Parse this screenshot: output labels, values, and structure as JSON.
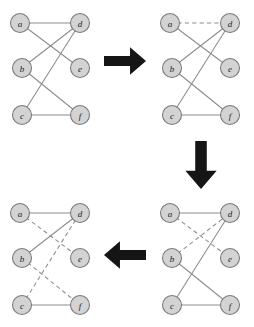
{
  "figure": {
    "title": "",
    "node_fill": "#d3d3d3",
    "node_stroke": "#7a7a7a",
    "edge_color": "#8c8c8c",
    "arrow_color": "#151515",
    "node_radius": 9.5
  },
  "node_positions": {
    "a": {
      "x": 18,
      "y": 21
    },
    "b": {
      "x": 20,
      "y": 66
    },
    "c": {
      "x": 20,
      "y": 113
    },
    "d": {
      "x": 78,
      "y": 21
    },
    "e": {
      "x": 78,
      "y": 66
    },
    "f": {
      "x": 78,
      "y": 113
    }
  },
  "panels": [
    {
      "id": "panel-top-left",
      "name": "graph-initial",
      "x": 2,
      "y": 2,
      "width": 98,
      "height": 135,
      "nodes": [
        {
          "id": "a",
          "label": "a"
        },
        {
          "id": "b",
          "label": "b"
        },
        {
          "id": "c",
          "label": "c"
        },
        {
          "id": "d",
          "label": "d"
        },
        {
          "id": "e",
          "label": "e"
        },
        {
          "id": "f",
          "label": "f"
        }
      ],
      "edges": [
        {
          "from": "a",
          "to": "d",
          "style": "solid"
        },
        {
          "from": "a",
          "to": "e",
          "style": "solid"
        },
        {
          "from": "b",
          "to": "d",
          "style": "solid"
        },
        {
          "from": "b",
          "to": "f",
          "style": "solid"
        },
        {
          "from": "c",
          "to": "d",
          "style": "solid"
        },
        {
          "from": "c",
          "to": "f",
          "style": "solid"
        }
      ]
    },
    {
      "id": "panel-top-right",
      "name": "graph-step-2",
      "x": 152,
      "y": 2,
      "width": 98,
      "height": 135,
      "nodes": [
        {
          "id": "a",
          "label": "a"
        },
        {
          "id": "b",
          "label": "b"
        },
        {
          "id": "c",
          "label": "c"
        },
        {
          "id": "d",
          "label": "d"
        },
        {
          "id": "e",
          "label": "e"
        },
        {
          "id": "f",
          "label": "f"
        }
      ],
      "edges": [
        {
          "from": "a",
          "to": "d",
          "style": "dashed"
        },
        {
          "from": "a",
          "to": "e",
          "style": "solid"
        },
        {
          "from": "b",
          "to": "d",
          "style": "solid"
        },
        {
          "from": "b",
          "to": "f",
          "style": "solid"
        },
        {
          "from": "c",
          "to": "d",
          "style": "solid"
        },
        {
          "from": "c",
          "to": "f",
          "style": "solid"
        }
      ]
    },
    {
      "id": "panel-bottom-right",
      "name": "graph-step-3",
      "x": 152,
      "y": 192,
      "width": 98,
      "height": 135,
      "nodes": [
        {
          "id": "a",
          "label": "a"
        },
        {
          "id": "b",
          "label": "b"
        },
        {
          "id": "c",
          "label": "c"
        },
        {
          "id": "d",
          "label": "d"
        },
        {
          "id": "e",
          "label": "e"
        },
        {
          "id": "f",
          "label": "f"
        }
      ],
      "edges": [
        {
          "from": "a",
          "to": "d",
          "style": "solid"
        },
        {
          "from": "a",
          "to": "e",
          "style": "dashed"
        },
        {
          "from": "b",
          "to": "d",
          "style": "dashed"
        },
        {
          "from": "b",
          "to": "f",
          "style": "solid"
        },
        {
          "from": "c",
          "to": "d",
          "style": "solid"
        },
        {
          "from": "c",
          "to": "f",
          "style": "solid"
        }
      ]
    },
    {
      "id": "panel-bottom-left",
      "name": "graph-final",
      "x": 2,
      "y": 192,
      "width": 98,
      "height": 135,
      "nodes": [
        {
          "id": "a",
          "label": "a"
        },
        {
          "id": "b",
          "label": "b"
        },
        {
          "id": "c",
          "label": "c"
        },
        {
          "id": "d",
          "label": "d"
        },
        {
          "id": "e",
          "label": "e"
        },
        {
          "id": "f",
          "label": "f"
        }
      ],
      "edges": [
        {
          "from": "a",
          "to": "d",
          "style": "solid"
        },
        {
          "from": "a",
          "to": "e",
          "style": "dashed"
        },
        {
          "from": "b",
          "to": "d",
          "style": "solid"
        },
        {
          "from": "b",
          "to": "f",
          "style": "dashed"
        },
        {
          "from": "c",
          "to": "d",
          "style": "dashed"
        },
        {
          "from": "c",
          "to": "f",
          "style": "solid"
        }
      ]
    }
  ],
  "arrows": [
    {
      "id": "arrow-right",
      "name": "arrow-right-icon",
      "direction": "right",
      "x": 104,
      "y": 46,
      "width": 42,
      "height": 30
    },
    {
      "id": "arrow-down",
      "name": "arrow-down-icon",
      "direction": "down",
      "x": 184,
      "y": 141,
      "width": 34,
      "height": 48
    },
    {
      "id": "arrow-left",
      "name": "arrow-left-icon",
      "direction": "left",
      "x": 104,
      "y": 240,
      "width": 42,
      "height": 30
    }
  ]
}
